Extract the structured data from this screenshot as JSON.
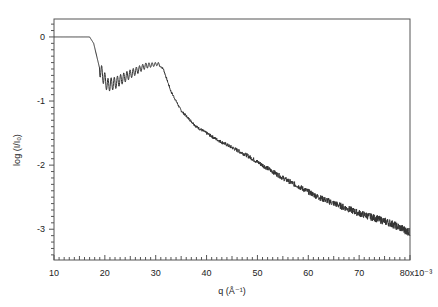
{
  "chart_data": {
    "type": "line",
    "title": "",
    "xlabel": "q (Å⁻¹)",
    "ylabel": "log (I/I₀)",
    "x_scale_note": "x10⁻³",
    "xlim": [
      10,
      80
    ],
    "ylim": [
      -3.48,
      0.28
    ],
    "xticks": [
      10,
      20,
      30,
      40,
      50,
      60,
      70,
      80
    ],
    "xtick_labels": [
      "10",
      "20",
      "30",
      "40",
      "50",
      "60",
      "70",
      "80x10⁻³"
    ],
    "yticks": [
      0,
      -1,
      -2,
      -3
    ],
    "ytick_labels": [
      "0",
      "-1",
      "-2",
      "-3"
    ],
    "grid": false,
    "legend": null,
    "series": [
      {
        "name": "log (I/I0)",
        "color": "#333333",
        "x": [
          10,
          17,
          17.8,
          19,
          20.5,
          22,
          25,
          28,
          30.5,
          31.5,
          33,
          35,
          38,
          42,
          48,
          55,
          62,
          70,
          76,
          80
        ],
        "y": [
          0,
          0,
          -0.1,
          -0.5,
          -0.75,
          -0.72,
          -0.58,
          -0.45,
          -0.42,
          -0.5,
          -0.85,
          -1.15,
          -1.4,
          -1.6,
          -1.85,
          -2.2,
          -2.5,
          -2.75,
          -2.9,
          -3.05
        ]
      }
    ],
    "annotations": [
      "oscillations/fringes between q≈19 and q≈31 (x10⁻³)",
      "increasing noise at high q"
    ]
  }
}
